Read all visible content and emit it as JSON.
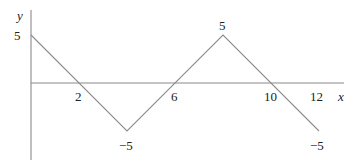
{
  "chart_data": {
    "type": "line",
    "title": "",
    "xlabel": "x",
    "ylabel": "y",
    "x": [
      0,
      4,
      8,
      12
    ],
    "series": [
      {
        "name": "f(x)",
        "values": [
          5,
          -5,
          5,
          -5
        ]
      }
    ],
    "x_intercepts": [
      2,
      6,
      10
    ],
    "xticks": [
      "2",
      "6",
      "10",
      "12"
    ],
    "point_labels": [
      {
        "x": 0,
        "y": 5,
        "text": "5"
      },
      {
        "x": 4,
        "y": -5,
        "text": "−5"
      },
      {
        "x": 8,
        "y": 5,
        "text": "5"
      },
      {
        "x": 12,
        "y": -5,
        "text": "−5"
      }
    ],
    "xlim": [
      0,
      13
    ],
    "ylim": [
      -7.5,
      8
    ],
    "grid": false,
    "legend": "none",
    "colors": {
      "axis": "#8a8a8a",
      "line": "#8c8c8c",
      "text": "#222222"
    }
  },
  "labels": {
    "y_axis": "y",
    "x_axis": "x",
    "y_start": "5",
    "tick_2": "2",
    "tick_6": "6",
    "tick_10": "10",
    "tick_12": "12",
    "trough": "−5",
    "peak": "5",
    "end": "−5"
  }
}
